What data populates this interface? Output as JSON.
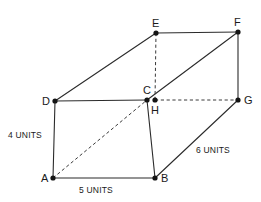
{
  "figure": {
    "shape_type": "rectangular-prism",
    "background_color": "#ffffff",
    "line_color": "#2b2b2b",
    "dashed_line_color": "#3a3a3a",
    "label_color": "#1a1a1a"
  },
  "vertices": [
    {
      "id": "A",
      "label": "A",
      "x": 53,
      "y": 178,
      "label_x": 41,
      "label_y": 182,
      "hidden": false
    },
    {
      "id": "B",
      "label": "B",
      "x": 155,
      "y": 178,
      "label_x": 161,
      "label_y": 182,
      "hidden": false
    },
    {
      "id": "C",
      "label": "C",
      "x": 147,
      "y": 100,
      "label_x": 143,
      "label_y": 94,
      "hidden": false
    },
    {
      "id": "D",
      "label": "D",
      "x": 55,
      "y": 101,
      "label_x": 42,
      "label_y": 105,
      "hidden": false
    },
    {
      "id": "E",
      "label": "E",
      "x": 156,
      "y": 33,
      "label_x": 152,
      "label_y": 27,
      "hidden": false
    },
    {
      "id": "F",
      "label": "F",
      "x": 238,
      "y": 32,
      "label_x": 234,
      "label_y": 26,
      "hidden": false
    },
    {
      "id": "G",
      "label": "G",
      "x": 238,
      "y": 100,
      "label_x": 244,
      "label_y": 104,
      "hidden": false
    },
    {
      "id": "H",
      "label": "H",
      "x": 155,
      "y": 100,
      "label_x": 151,
      "label_y": 114,
      "hidden": false
    }
  ],
  "edges": [
    {
      "id": "edge-d-e",
      "from": "D",
      "to": "E",
      "style": "solid"
    },
    {
      "id": "edge-e-f",
      "from": "E",
      "to": "F",
      "style": "solid"
    },
    {
      "id": "edge-f-g",
      "from": "F",
      "to": "G",
      "style": "solid"
    },
    {
      "id": "edge-f-c",
      "from": "F",
      "to": "C",
      "style": "solid"
    },
    {
      "id": "edge-d-c",
      "from": "D",
      "to": "C",
      "style": "solid"
    },
    {
      "id": "edge-a-d",
      "from": "A",
      "to": "D",
      "style": "solid"
    },
    {
      "id": "edge-a-b",
      "from": "A",
      "to": "B",
      "style": "solid"
    },
    {
      "id": "edge-b-c",
      "from": "B",
      "to": "C",
      "style": "solid"
    },
    {
      "id": "edge-b-g",
      "from": "B",
      "to": "G",
      "style": "solid"
    },
    {
      "id": "edge-a-c",
      "from": "A",
      "to": "C",
      "style": "dashed"
    },
    {
      "id": "edge-e-h",
      "from": "E",
      "to": "H",
      "style": "dashed"
    },
    {
      "id": "edge-h-g",
      "from": "H",
      "to": "G",
      "style": "dashed"
    }
  ],
  "measurements": [
    {
      "id": "height-label",
      "text": "4 UNITS",
      "x": 8,
      "y": 138,
      "edge": "A-D",
      "value": 4,
      "unit": "UNITS"
    },
    {
      "id": "width-label",
      "text": "5 UNITS",
      "x": 79,
      "y": 193,
      "edge": "A-B",
      "value": 5,
      "unit": "UNITS"
    },
    {
      "id": "depth-label",
      "text": "6 UNITS",
      "x": 196,
      "y": 153,
      "edge": "B-G",
      "value": 6,
      "unit": "UNITS"
    }
  ]
}
